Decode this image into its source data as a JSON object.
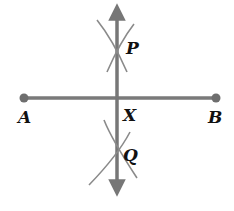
{
  "figure": {
    "type": "perpendicular bisector construction",
    "colors": {
      "segment": "#7a7a7a",
      "bisector": "#777777",
      "arc": "#8a8a8a",
      "label": "#111111",
      "background": "#ffffff"
    },
    "points": {
      "A": {
        "label": "A",
        "x": 24,
        "y": 98
      },
      "B": {
        "label": "B",
        "x": 216,
        "y": 98
      },
      "X": {
        "label": "X",
        "x": 117,
        "y": 98
      },
      "P": {
        "label": "P",
        "x": 117,
        "y": 47
      },
      "Q": {
        "label": "Q",
        "x": 117,
        "y": 153
      }
    },
    "segment_AB": {
      "from": "A",
      "to": "B",
      "endpoints": "dots"
    },
    "line_PQ": {
      "through": [
        "P",
        "Q"
      ],
      "ends": "arrows",
      "top_y": 5,
      "bottom_y": 195
    },
    "arcs": [
      {
        "near": "P",
        "count": 2
      },
      {
        "near": "Q",
        "count": 2
      }
    ]
  }
}
